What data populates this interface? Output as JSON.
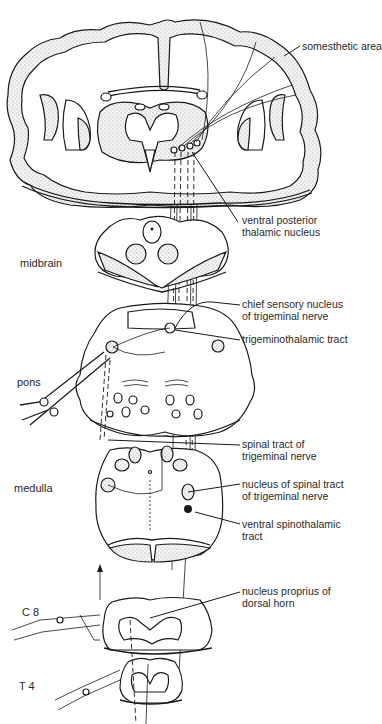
{
  "figure": {
    "labels": {
      "somesthetic_area": "somesthetic area",
      "vpn_line1": "ventral posterior",
      "vpn_line2": "thalamic nucleus",
      "chief_line1": "chief sensory nucleus",
      "chief_line2": "of trigeminal nerve",
      "trigeminothalamic": "trigeminothalamic tract",
      "spinal_tract_line1": "spinal tract of",
      "spinal_tract_line2": "trigeminal nerve",
      "nucleus_spinal_line1": "nucleus of spinal tract",
      "nucleus_spinal_line2": "of trigeminal nerve",
      "vst_line1": "ventral spinothalamic",
      "vst_line2": "tract",
      "proprius_line1": "nucleus proprius of",
      "proprius_line2": "dorsal horn"
    },
    "levels": {
      "midbrain": "midbrain",
      "pons": "pons",
      "medulla": "medulla",
      "c8": "C 8",
      "t4": "T 4"
    }
  }
}
